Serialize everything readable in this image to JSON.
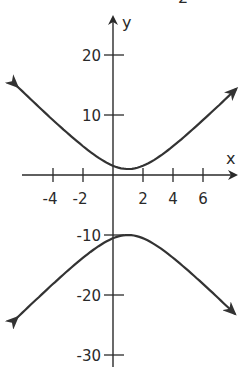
{
  "chart_data": {
    "type": "line",
    "title": "",
    "xlabel": "x",
    "ylabel": "y",
    "xlim": [
      -7,
      8.3
    ],
    "ylim": [
      -32,
      25
    ],
    "grid": false,
    "legend": null,
    "x_ticks": [
      -4,
      -2,
      2,
      4,
      6
    ],
    "x_tick_labels": [
      "-4",
      "-2",
      "2",
      "4",
      "6"
    ],
    "y_ticks": [
      20,
      10,
      -10,
      -20,
      -30
    ],
    "y_tick_labels": [
      "20",
      "10",
      "-10",
      "-20",
      "-30"
    ],
    "series": [
      {
        "name": "upper branch",
        "description": "Upward-opening hyperbola branch with arrows at both ends",
        "vertex": [
          1,
          1
        ],
        "endpoints": [
          [
            -6.4,
            14.8
          ],
          [
            8.2,
            14.5
          ]
        ]
      },
      {
        "name": "lower branch",
        "description": "Downward-opening hyperbola branch with arrows at both ends",
        "vertex": [
          1,
          -10
        ],
        "endpoints": [
          [
            -6.4,
            -23
          ],
          [
            8.1,
            -23.2
          ]
        ]
      }
    ],
    "annotations": [
      "2"
    ]
  },
  "labels": {
    "x_axis": "x",
    "y_axis": "y",
    "partial_top_glyph": "2",
    "x_ticks": [
      "-4",
      "-2",
      "2",
      "4",
      "6"
    ],
    "y_ticks": [
      "20",
      "10",
      "-10",
      "-20",
      "-30"
    ]
  },
  "style": {
    "ink": "#2a2a2a",
    "curve": "#3a3a3a",
    "background": "#ffffff"
  }
}
